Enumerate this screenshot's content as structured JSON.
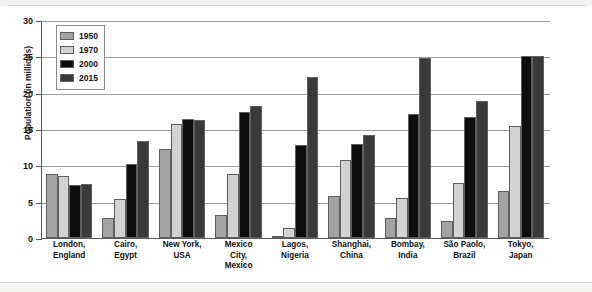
{
  "chart_data": {
    "type": "bar",
    "title": "",
    "xlabel": "",
    "ylabel": "Population (in millions)",
    "ylim": [
      0,
      30
    ],
    "yticks": [
      0,
      5,
      10,
      15,
      20,
      25,
      30
    ],
    "ytick_labels": [
      "0",
      "5",
      "10",
      "15",
      "20",
      "25",
      "30"
    ],
    "grid": true,
    "legend_position": "top-left",
    "categories": [
      "London,\nEngland",
      "Cairo,\nEgypt",
      "New York,\nUSA",
      "Mexico\nCity,\nMexico",
      "Lagos,\nNigeria",
      "Shanghai,\nChina",
      "Bombay,\nIndia",
      "São Paolo,\nBrazil",
      "Tokyo,\nJapan"
    ],
    "category_lines": [
      [
        "London,",
        "England"
      ],
      [
        "Cairo,",
        "Egypt"
      ],
      [
        "New York,",
        "USA"
      ],
      [
        "Mexico",
        "City,",
        "Mexico"
      ],
      [
        "Lagos,",
        "Nigeria"
      ],
      [
        "Shanghai,",
        "China"
      ],
      [
        "Bombay,",
        "India"
      ],
      [
        "São Paolo,",
        "Brazil"
      ],
      [
        "Tokyo,",
        "Japan"
      ]
    ],
    "series": [
      {
        "name": "1950",
        "color": "#a3a3a3",
        "values": [
          8.8,
          2.7,
          12.3,
          3.1,
          0.3,
          5.8,
          2.8,
          2.4,
          6.5
        ]
      },
      {
        "name": "1970",
        "color": "#d2d2d2",
        "values": [
          8.5,
          5.4,
          15.7,
          8.8,
          1.4,
          10.7,
          5.5,
          7.6,
          15.4
        ]
      },
      {
        "name": "2000",
        "color": "#0d0d0d",
        "values": [
          7.3,
          10.2,
          16.4,
          17.3,
          12.8,
          12.9,
          17.1,
          16.6,
          25.0
        ]
      },
      {
        "name": "2015",
        "color": "#3a3a3a",
        "values": [
          7.4,
          13.4,
          16.3,
          18.2,
          22.1,
          14.2,
          24.8,
          18.8,
          25.0
        ]
      }
    ]
  },
  "legend": {
    "items": [
      {
        "label": "1950",
        "color": "#a3a3a3"
      },
      {
        "label": "1970",
        "color": "#d2d2d2"
      },
      {
        "label": "2000",
        "color": "#0d0d0d"
      },
      {
        "label": "2015",
        "color": "#3a3a3a"
      }
    ]
  }
}
